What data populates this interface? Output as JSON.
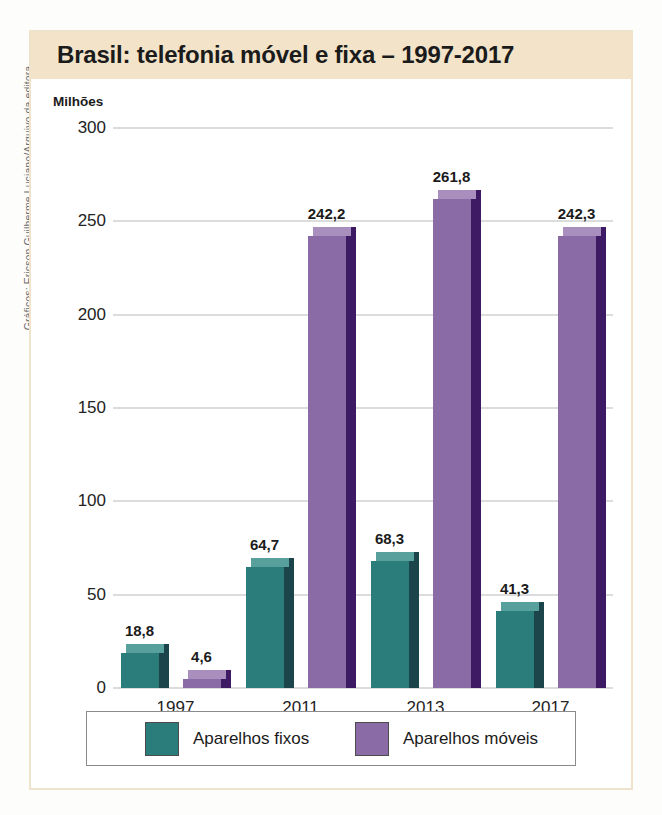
{
  "credit": "Gráficos: Ericson Guilherme Luciano/Arquivo da editora",
  "figure": {
    "title": "Brasil: telefonia móvel e fixa – 1997-2017",
    "unit_label": "Milhões"
  },
  "colors": {
    "title_band": "#f3e4c9",
    "frame": "#f0e3cb",
    "fixed_front": "#2b7d7b",
    "fixed_side": "#1b454a",
    "fixed_top": "#57a09c",
    "mobile_front": "#8b6ba5",
    "mobile_side": "#3d1a63",
    "mobile_top": "#a98fbd",
    "gridline": "#b9b9b9"
  },
  "chart_data": {
    "type": "bar",
    "title": "Brasil: telefonia móvel e fixa – 1997-2017",
    "xlabel": "",
    "ylabel": "Milhões",
    "ylim": [
      0,
      300
    ],
    "yticks": [
      0,
      50,
      100,
      150,
      200,
      250,
      300
    ],
    "ytick_labels": [
      "0",
      "50",
      "100",
      "150",
      "200",
      "250",
      "300"
    ],
    "grid": true,
    "legend_position": "bottom",
    "categories": [
      "1997",
      "2011",
      "2013",
      "2017"
    ],
    "series": [
      {
        "name": "Aparelhos fixos",
        "color": "#2b7d7b",
        "values": [
          18.8,
          64.7,
          68.3,
          41.3
        ],
        "labels": [
          "18,8",
          "64,7",
          "68,3",
          "41,3"
        ]
      },
      {
        "name": "Aparelhos móveis",
        "color": "#8b6ba5",
        "values": [
          4.6,
          242.2,
          261.8,
          242.3
        ],
        "labels": [
          "4,6",
          "242,2",
          "261,8",
          "242,3"
        ]
      }
    ]
  },
  "legend": {
    "items": [
      {
        "label": "Aparelhos fixos",
        "color": "#2b7d7b"
      },
      {
        "label": "Aparelhos móveis",
        "color": "#8b6ba5"
      }
    ]
  }
}
